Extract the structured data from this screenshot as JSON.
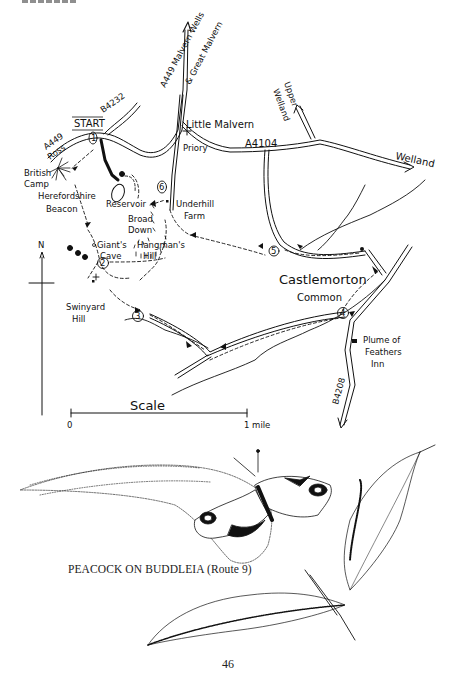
{
  "page": {
    "page_number": "46",
    "caption": "PEACOCK ON BUDDLEIA (Route 9)"
  },
  "map": {
    "start_label": "START",
    "roads": {
      "a449_north": "A449 Malvern Wells",
      "a449_north_2": "& Great Malvern",
      "a449_ross": "A449",
      "a449_ross_2": "Ross",
      "b4232": "B4232",
      "a4104": "A4104",
      "b4208": "B4208"
    },
    "places": {
      "little_malvern": "Little Malvern",
      "priory": "Priory",
      "upper_welland_1": "Upper",
      "upper_welland_2": "Welland",
      "welland": "Welland",
      "british_camp_1": "British",
      "british_camp_2": "Camp",
      "herefordshire_beacon_1": "Herefordshire",
      "herefordshire_beacon_2": "Beacon",
      "reservoir": "Reservoir",
      "underhill_farm_1": "Underhill",
      "underhill_farm_2": "Farm",
      "broad_down_1": "Broad",
      "broad_down_2": "Down",
      "giants_cave_1": "Giant's",
      "giants_cave_2": "Cave",
      "hangmans_hill_1": "Hangman's",
      "hangmans_hill_2": "Hill",
      "swinyard_hill_1": "Swinyard",
      "swinyard_hill_2": "Hill",
      "castlemorton": "Castlemorton",
      "common": "Common",
      "plume_1": "Plume of",
      "plume_2": "Feathers",
      "plume_3": "Inn"
    },
    "waypoints": [
      "1",
      "2",
      "3",
      "4",
      "5",
      "6"
    ],
    "north_label": "N",
    "scale": {
      "title": "Scale",
      "start": "0",
      "end": "1 mile"
    }
  }
}
